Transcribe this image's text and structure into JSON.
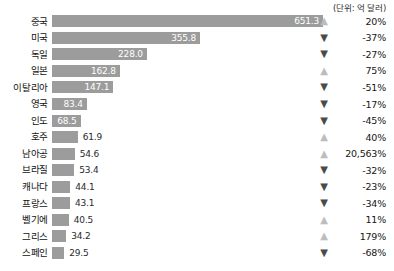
{
  "unit_caption": "(단위: 억 달러)",
  "chart_data": {
    "type": "bar",
    "title": "",
    "subtitle": "",
    "xlabel": "",
    "ylabel": "",
    "unit_note": "(단위: 억 달러)",
    "orientation": "horizontal",
    "grid": false,
    "legend": "none",
    "xlim": [
      0,
      651.3
    ],
    "categories": [
      "중국",
      "미국",
      "독일",
      "일본",
      "이탈리아",
      "영국",
      "인도",
      "호주",
      "남아공",
      "브라질",
      "캐나다",
      "프랑스",
      "벨기에",
      "그리스",
      "스페인"
    ],
    "values": [
      651.3,
      355.8,
      228.0,
      162.8,
      147.1,
      83.4,
      68.5,
      61.9,
      54.6,
      53.4,
      44.1,
      43.1,
      40.5,
      34.2,
      29.5
    ],
    "value_labels": [
      "651.3",
      "355.8",
      "228.0",
      "162.8",
      "147.1",
      "83.4",
      "68.5",
      "61.9",
      "54.6",
      "53.4",
      "44.1",
      "43.1",
      "40.5",
      "34.2",
      "29.5"
    ],
    "change_labels": [
      "20%",
      "-37%",
      "-27%",
      "75%",
      "-51%",
      "-17%",
      "-45%",
      "40%",
      "20,563%",
      "-32%",
      "-23%",
      "-34%",
      "11%",
      "179%",
      "-68%"
    ],
    "change_values": [
      20,
      -37,
      -27,
      75,
      -51,
      -17,
      -45,
      40,
      20563,
      -32,
      -23,
      -34,
      11,
      179,
      -68
    ],
    "change_directions": [
      "up",
      "down",
      "down",
      "up",
      "down",
      "down",
      "down",
      "up",
      "up",
      "down",
      "down",
      "down",
      "up",
      "up",
      "down"
    ],
    "bar_color": "#9c9c9c",
    "arrow_up_color": "#bdbdbd",
    "arrow_down_color": "#4a4a4a",
    "label_inside_color": "#ffffff",
    "label_outside_color": "#2a2a2a"
  },
  "icons": {
    "arrow_up": "▲",
    "arrow_down": "▼"
  }
}
